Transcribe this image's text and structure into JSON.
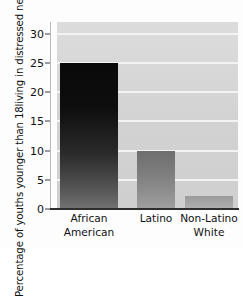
{
  "chart_data": {
    "type": "bar",
    "title": "",
    "subtitle": "",
    "xlabel": "",
    "ylabel": "Percentage of youths younger than 18 living in distressed neighborhoods",
    "ylabel_lines": [
      "Percentage of youths younger than 18",
      "living in distressed neighborhoods"
    ],
    "categories": [
      "African American",
      "Latino",
      "Non-Latino White"
    ],
    "category_lines": [
      [
        "African",
        "American"
      ],
      [
        "Latino",
        ""
      ],
      [
        "Non-Latino",
        "White"
      ]
    ],
    "values": [
      25,
      10,
      2.3
    ],
    "ylim": [
      0,
      32
    ],
    "yticks": [
      0,
      5,
      10,
      15,
      20,
      25,
      30
    ],
    "ytick_labels": [
      "0",
      "5",
      "10",
      "15",
      "20",
      "25",
      "30"
    ],
    "grid": "horizontal-white-lines",
    "legend": "none",
    "bar_fills": [
      "dark-gradient",
      "medium-gradient",
      "light-gradient"
    ],
    "plot_background": "#d5d5d5",
    "gridline_color": "#f4f4f4",
    "axis_color": "#2e2e2e"
  }
}
